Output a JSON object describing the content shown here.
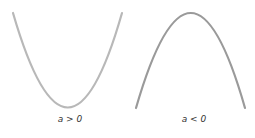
{
  "diagram": {
    "title": "",
    "panels": [
      {
        "id": "upward",
        "label": "a > 0",
        "shape": "upward-opening parabola",
        "color": "#b8b8b8"
      },
      {
        "id": "downward",
        "label": "a < 0",
        "shape": "downward-opening parabola",
        "color": "#9a9a9a"
      }
    ]
  }
}
